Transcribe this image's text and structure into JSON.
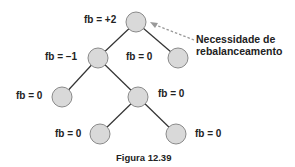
{
  "diagram": {
    "type": "avl-tree",
    "nodes": [
      {
        "id": "root",
        "label": "fb = +2",
        "cx": 136,
        "cy": 22
      },
      {
        "id": "l",
        "label": "fb = –1",
        "cx": 98,
        "cy": 58
      },
      {
        "id": "r",
        "label": "fb = 0",
        "cx": 178,
        "cy": 58
      },
      {
        "id": "ll",
        "label": "fb = 0",
        "cx": 62,
        "cy": 97
      },
      {
        "id": "lr",
        "label": "fb = 0",
        "cx": 138,
        "cy": 97
      },
      {
        "id": "lrl",
        "label": "fb = 0",
        "cx": 100,
        "cy": 134
      },
      {
        "id": "lrr",
        "label": "fb = 0",
        "cx": 176,
        "cy": 134
      }
    ],
    "edges": [
      [
        "root",
        "l"
      ],
      [
        "root",
        "r"
      ],
      [
        "l",
        "ll"
      ],
      [
        "l",
        "lr"
      ],
      [
        "lr",
        "lrl"
      ],
      [
        "lr",
        "lrr"
      ]
    ],
    "annotation": {
      "line1": "Necessidade de",
      "line2": "rebalanceamento",
      "target": "root"
    },
    "caption": "Figura 12.39",
    "colors": {
      "node_fill": "#d9d9d9",
      "node_stroke": "#8a8a8a",
      "edge": "#333333",
      "arrow": "#999999"
    }
  }
}
